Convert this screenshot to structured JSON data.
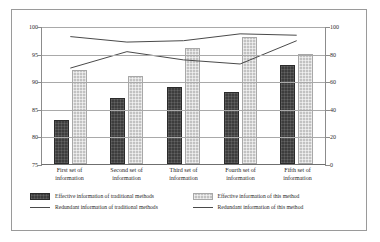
{
  "chart_data": {
    "type": "bar",
    "title": "",
    "subtitle": "",
    "xlabel": "",
    "ylabel": "",
    "grid": true,
    "legend_position": "bottom",
    "categories": [
      "First set of information",
      "Second set of information",
      "Third set of information",
      "Fourth set of information",
      "Fifth set of information"
    ],
    "category_lines": [
      [
        "First set of",
        "information"
      ],
      [
        "Second set of",
        "information"
      ],
      [
        "Third set of",
        "information"
      ],
      [
        "Fourth set of",
        "information"
      ],
      [
        "Fifth set of",
        "information"
      ]
    ],
    "left_axis": {
      "ylim": [
        75,
        100
      ],
      "ticks": [
        75,
        80,
        85,
        90,
        95,
        100
      ],
      "tick_labels": [
        "75",
        "80",
        "85",
        "90",
        "95",
        "100"
      ]
    },
    "right_axis": {
      "ylim": [
        0,
        100
      ],
      "ticks": [
        0,
        20,
        40,
        60,
        80,
        100
      ],
      "tick_labels": [
        "0",
        "20",
        "40",
        "60",
        "80",
        "100"
      ]
    },
    "series": [
      {
        "name": "Effective information of traditional methods",
        "kind": "bar",
        "axis": "left",
        "color": "#3d3d3d",
        "values": [
          83,
          87,
          89,
          88,
          93
        ]
      },
      {
        "name": "Effective information of this method",
        "kind": "bar",
        "axis": "left",
        "color": "#c2c2c2",
        "values": [
          92,
          91,
          96,
          98,
          95
        ]
      },
      {
        "name": "Redundant information of traditional methods",
        "kind": "line",
        "axis": "right",
        "color": "#4a4a4a",
        "values": [
          93,
          89,
          90,
          95,
          94
        ]
      },
      {
        "name": "Redundant information of this method",
        "kind": "line",
        "axis": "right",
        "color": "#4a4a4a",
        "values": [
          70,
          82,
          76,
          73,
          90
        ]
      }
    ]
  },
  "legend": {
    "items": [
      {
        "label": "Effective information of traditional methods",
        "marker": "bar-dark"
      },
      {
        "label": "Effective information of this method",
        "marker": "bar-light"
      },
      {
        "label": "Redundant information of traditional methods",
        "marker": "line"
      },
      {
        "label": "Redundant information of this method",
        "marker": "line"
      }
    ]
  }
}
